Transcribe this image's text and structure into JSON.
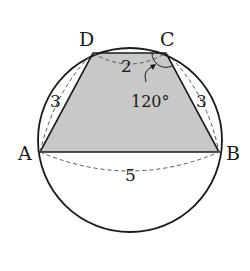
{
  "diagram": {
    "type": "cyclic-quadrilateral",
    "vertices": {
      "A": {
        "label": "A"
      },
      "B": {
        "label": "B"
      },
      "C": {
        "label": "C"
      },
      "D": {
        "label": "D"
      }
    },
    "sides": {
      "AB": "5",
      "BC": "3",
      "CD": "2",
      "DA": "3"
    },
    "angle": {
      "at": "C",
      "value": "120°"
    },
    "colors": {
      "stroke": "#1a1a1a",
      "fill": "#c8c8c8",
      "dashed": "#555555"
    }
  }
}
